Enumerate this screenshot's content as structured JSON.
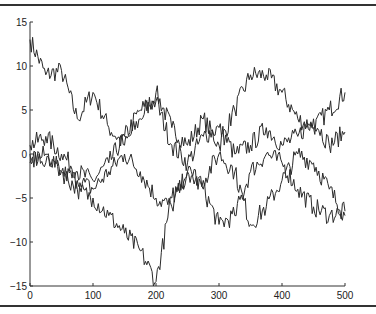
{
  "chart_data": {
    "type": "line",
    "title": "",
    "xlabel": "",
    "ylabel": "",
    "xlim": [
      0,
      500
    ],
    "ylim": [
      -15,
      15
    ],
    "grid": false,
    "legend": null,
    "x_ticks": [
      "0",
      "100",
      "200",
      "300",
      "400",
      "500"
    ],
    "y_ticks": [
      "-15",
      "-10",
      "-5",
      "0",
      "5",
      "10",
      "15"
    ],
    "x": [
      0,
      25,
      50,
      75,
      100,
      125,
      150,
      175,
      200,
      225,
      250,
      275,
      300,
      325,
      350,
      375,
      400,
      425,
      450,
      475,
      500
    ],
    "series": [
      {
        "name": "walk 1",
        "values": [
          13,
          9,
          9.5,
          4,
          7,
          3,
          1,
          4,
          7,
          3,
          1,
          4,
          1,
          5,
          9,
          9,
          7,
          4,
          3,
          5,
          7
        ]
      },
      {
        "name": "walk 2",
        "values": [
          1,
          2,
          0,
          -2,
          -3,
          -1,
          2,
          5,
          6,
          1,
          -1,
          2,
          3,
          0,
          1,
          3,
          1,
          2,
          4,
          1,
          2.5
        ]
      },
      {
        "name": "walk 3",
        "values": [
          0,
          -1,
          -2,
          -3,
          -4,
          -2,
          0,
          -2,
          -5,
          -6,
          -2,
          -4,
          -8,
          -7,
          -2,
          0,
          -1,
          -4,
          -6,
          -7,
          -6.5
        ]
      },
      {
        "name": "walk 4",
        "values": [
          -1,
          0,
          -2,
          -4,
          -5,
          -7,
          -9,
          -11,
          -14.5,
          -5,
          -2,
          -3,
          0,
          -2,
          -8,
          -6,
          -3,
          0,
          -1,
          -4,
          -7
        ]
      }
    ]
  }
}
